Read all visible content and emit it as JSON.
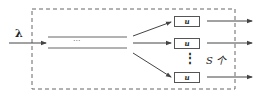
{
  "diagram": {
    "input_label": "λ",
    "ellipsis_horizontal": "···",
    "ellipsis_vertical": "⋮",
    "unit_boxes": [
      {
        "label": "u"
      },
      {
        "label": "u"
      },
      {
        "label": "u"
      }
    ],
    "count_label": "S 个",
    "colors": {
      "line": "#555555",
      "dashed_border": "#666666",
      "text": "#222222"
    }
  }
}
